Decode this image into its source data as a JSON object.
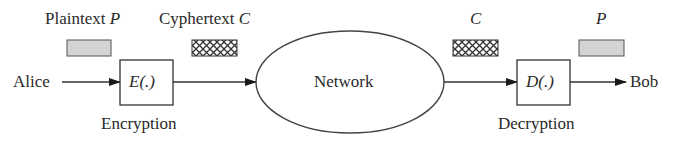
{
  "diagram": {
    "labels": {
      "plaintext_top": "Plaintext",
      "plaintext_symbol": "P",
      "cyphertext_top": "Cyphertext",
      "cyphertext_symbol": "C",
      "network_c": "C",
      "bob_p": "P",
      "sender": "Alice",
      "receiver": "Bob",
      "encrypt_fn": "E(.)",
      "decrypt_fn": "D(.)",
      "encryption": "Encryption",
      "decryption": "Decryption",
      "network": "Network"
    },
    "nodes": [
      {
        "id": "alice",
        "label": "Alice",
        "shape": "text"
      },
      {
        "id": "encrypt",
        "label": "E(.)",
        "caption": "Encryption",
        "shape": "rect"
      },
      {
        "id": "network",
        "label": "Network",
        "shape": "ellipse"
      },
      {
        "id": "decrypt",
        "label": "D(.)",
        "caption": "Decryption",
        "shape": "rect"
      },
      {
        "id": "bob",
        "label": "Bob",
        "shape": "text"
      }
    ],
    "edges": [
      {
        "from": "alice",
        "to": "encrypt",
        "data": "Plaintext P"
      },
      {
        "from": "encrypt",
        "to": "network",
        "data": "Cyphertext C"
      },
      {
        "from": "network",
        "to": "decrypt",
        "data": "C"
      },
      {
        "from": "decrypt",
        "to": "bob",
        "data": "P"
      }
    ],
    "colors": {
      "stroke": "#3a3a3a",
      "plaintext_fill": "#d4d4d4",
      "cyphertext_fill": "#ffffff"
    }
  }
}
